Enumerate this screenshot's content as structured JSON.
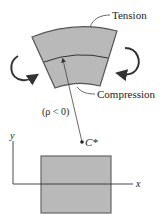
{
  "diagram": {
    "labels": {
      "tension": "Tension",
      "compression": "Compression",
      "radius": "(ρ < 0)",
      "center": "C*",
      "x_axis": "x",
      "y_axis": "y"
    },
    "colors": {
      "fill": "#b9b9b9",
      "stroke": "#555555",
      "line": "#333333",
      "text": "#222222"
    }
  }
}
